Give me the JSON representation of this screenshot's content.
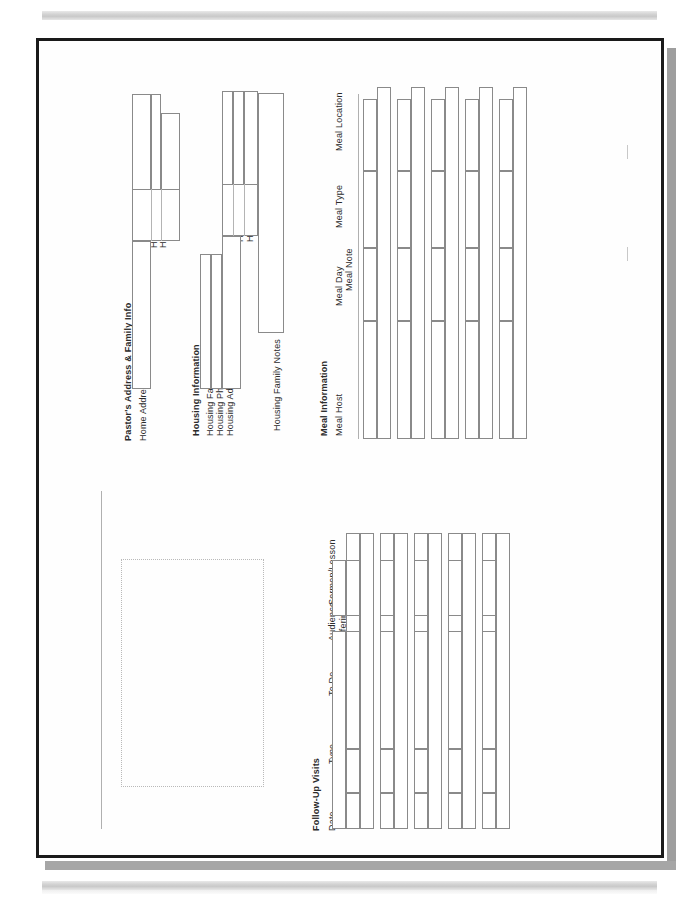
{
  "document": {
    "kind": "scanned-form-page",
    "orientation": "rotated-90-ccw",
    "paper_color": "#fefefe",
    "border_color": "#1a1a1a",
    "shadow_color": "#9e9e9e",
    "scanbar_color": "#d3d3d3",
    "field_border_color": "#8a8a8a"
  },
  "sections": [
    {
      "id": "pastor-address",
      "title": "Pastor's Address & Family Info",
      "fields": [
        {
          "label": "Home Address"
        },
        {
          "label": "Home City"
        },
        {
          "label": "Home State"
        },
        {
          "label": "Home ZIP"
        }
      ]
    },
    {
      "id": "housing-information",
      "title": "Housing Information",
      "fields": [
        {
          "label": "Housing Family"
        },
        {
          "label": "Housing Phone"
        },
        {
          "label": "Housing Address"
        },
        {
          "label": "Housing City"
        },
        {
          "label": "Housing State"
        },
        {
          "label": "Housing ZIP"
        },
        {
          "label": "Housing Family Notes"
        }
      ]
    },
    {
      "id": "meal-information",
      "title": "Meal Information",
      "columns": [
        {
          "label": "Meal Host"
        },
        {
          "label": "Meal Day"
        },
        {
          "label": "Meal Type"
        },
        {
          "label": "Meal Location"
        },
        {
          "label": "Meal Note"
        }
      ],
      "row_count": 5
    },
    {
      "id": "follow-up-visits",
      "title": "Follow-Up Visits",
      "columns": [
        {
          "label": "Date"
        },
        {
          "label": "Type"
        },
        {
          "label": "Results"
        },
        {
          "label": "To Do"
        },
        {
          "label": "Audience"
        },
        {
          "label": "Offering$"
        },
        {
          "label": "Sermon/Lesson"
        }
      ],
      "row_count": 5
    }
  ],
  "marks": {
    "dotted_placeholder": "",
    "tick_count": 2
  }
}
